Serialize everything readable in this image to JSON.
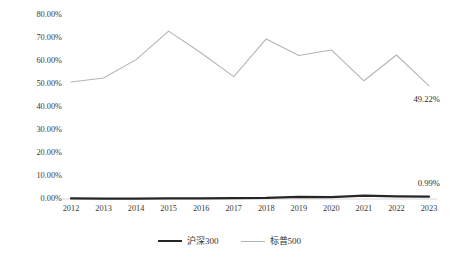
{
  "chart_data": {
    "type": "line",
    "title": "",
    "xlabel": "",
    "ylabel": "",
    "grid": false,
    "legend_position": "bottom",
    "ylim": [
      0,
      80
    ],
    "ytick_labels": [
      "80.00%",
      "70.00%",
      "60.00%",
      "50.00%",
      "40.00%",
      "30.00%",
      "20.00%",
      "10.00%",
      "0.00%"
    ],
    "ytick_values": [
      80,
      70,
      60,
      50,
      40,
      30,
      20,
      10,
      0
    ],
    "categories": [
      "2012",
      "2013",
      "2014",
      "2015",
      "2016",
      "2017",
      "2018",
      "2019",
      "2020",
      "2021",
      "2022",
      "2023"
    ],
    "x": [
      2012,
      2013,
      2014,
      2015,
      2016,
      2017,
      2018,
      2019,
      2020,
      2021,
      2022,
      2023
    ],
    "series": [
      {
        "name": "沪深300",
        "color": "#262626",
        "line_width": 2.2,
        "values": [
          0.25,
          0.2,
          0.2,
          0.25,
          0.3,
          0.35,
          0.45,
          0.9,
          0.85,
          1.45,
          1.1,
          0.99
        ]
      },
      {
        "name": "标普500",
        "color": "#b4b4b4",
        "line_width": 1.1,
        "values": [
          50.9,
          52.6,
          60.6,
          73.0,
          63.5,
          53.2,
          69.6,
          62.4,
          64.8,
          51.4,
          62.6,
          49.22
        ]
      }
    ],
    "annotations": [
      {
        "text": "49.22%",
        "series": "标普500",
        "category": "2023",
        "value": 49.22
      },
      {
        "text": "0.99%",
        "series": "沪深300",
        "category": "2023",
        "value": 0.99
      }
    ]
  },
  "labels": {
    "annotation_sp500": "49.22%",
    "annotation_csi300": "0.99%"
  },
  "legend": {
    "items": [
      {
        "label": "沪深300"
      },
      {
        "label": "标普500"
      }
    ]
  },
  "colors": {
    "csi300_line": "#262626",
    "sp500_line": "#b4b4b4",
    "axis": "#d2d2d2",
    "text": "#3a3a3a"
  }
}
